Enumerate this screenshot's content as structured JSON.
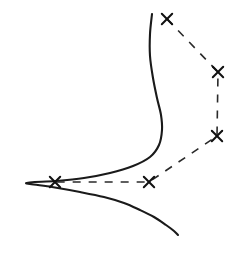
{
  "figure": {
    "background_color": "#ffffff",
    "width": 231,
    "height": 258,
    "curve_color": "#1a1a1a",
    "dashed_color": "#2a2a2a",
    "marker_color": "#111111",
    "marker_glyph": "x-cross-marker",
    "dash_pattern": "8 8"
  },
  "chart_data": {
    "type": "line",
    "title": "",
    "subtitle": "",
    "xlabel": "",
    "ylabel": "",
    "grid": false,
    "legend": "none",
    "axes_visible": false,
    "tick_labels": [],
    "annotations": [],
    "xlim": [
      0,
      231
    ],
    "ylim": [
      258,
      0
    ],
    "orientation": "horizontal-peak-left",
    "series": [
      {
        "name": "solid-curve",
        "style": "solid",
        "marker": "none",
        "color": "#1a1a1a",
        "description": "sharply peaked distribution rotated 90 degrees, peak pointing left",
        "points": [
          [
            152,
            14
          ],
          [
            150,
            34
          ],
          [
            150,
            56
          ],
          [
            153,
            78
          ],
          [
            157,
            98
          ],
          [
            161,
            115
          ],
          [
            162,
            130
          ],
          [
            159,
            145
          ],
          [
            150,
            157
          ],
          [
            133,
            166
          ],
          [
            110,
            173
          ],
          [
            84,
            178
          ],
          [
            56,
            181
          ],
          [
            26,
            183
          ],
          [
            52,
            187
          ],
          [
            80,
            192
          ],
          [
            104,
            197
          ],
          [
            124,
            203
          ],
          [
            140,
            210
          ],
          [
            154,
            217
          ],
          [
            166,
            225
          ],
          [
            174,
            231
          ],
          [
            178,
            235
          ]
        ]
      },
      {
        "name": "dashed-marker-polyline",
        "style": "dashed",
        "marker": "x",
        "color": "#2a2a2a",
        "description": "dashed polyline joining five x markers",
        "points": [
          [
            167,
            19
          ],
          [
            218,
            72
          ],
          [
            217,
            136
          ],
          [
            149,
            182
          ],
          [
            55,
            182
          ]
        ]
      }
    ],
    "markers": [
      {
        "label": "",
        "x": 167,
        "y": 19
      },
      {
        "label": "",
        "x": 218,
        "y": 72
      },
      {
        "label": "",
        "x": 217,
        "y": 136
      },
      {
        "label": "",
        "x": 149,
        "y": 182
      },
      {
        "label": "",
        "x": 55,
        "y": 182
      }
    ]
  }
}
